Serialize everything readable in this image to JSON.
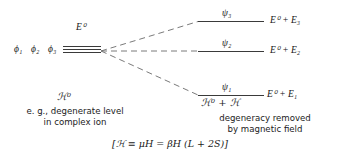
{
  "diagram": {
    "left": {
      "wavefunctions": [
        "ϕ₁",
        "ϕ₂",
        "ϕ₃"
      ],
      "level_label": "E⁰",
      "hamiltonian": "ℋ⁰",
      "caption_line1": "e. g., degenerate level",
      "caption_line2": "in complex ion"
    },
    "right": {
      "levels": [
        {
          "wavefunction": "ψ₃",
          "energy": "E⁰ + E₃"
        },
        {
          "wavefunction": "ψ₂",
          "energy": "E⁰ + E₂"
        },
        {
          "wavefunction": "ψ₁",
          "energy": "E⁰ + E₁"
        }
      ],
      "hamiltonian": "ℋ⁰ + ℋ",
      "caption_line1": "degeneracy removed",
      "caption_line2": "by magnetic field",
      "formula": "[ℋ ≡ μH = βH (L + 2S)]"
    },
    "colors": {
      "line": "#3a3a3a",
      "dashed": "#6b6b6b",
      "text": "#1a1a1a",
      "background": "#ffffff"
    }
  }
}
